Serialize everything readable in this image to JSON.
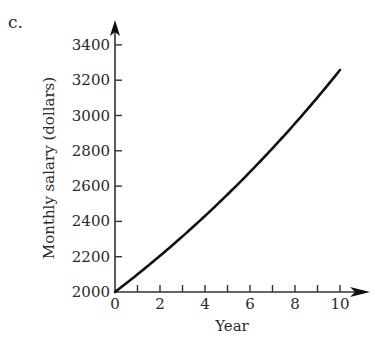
{
  "panel_label": "c.",
  "chart_data": {
    "type": "line",
    "title": "",
    "panel_label": "c.",
    "xlabel": "Year",
    "ylabel": "Monthly salary (dollars)",
    "xlim": [
      0,
      10
    ],
    "ylim": [
      2000,
      3400
    ],
    "x_ticks_major": [
      0,
      2,
      4,
      6,
      8,
      10
    ],
    "x_ticks_minor": [
      1,
      3,
      5,
      7,
      9
    ],
    "y_ticks": [
      2000,
      2200,
      2400,
      2600,
      2800,
      3000,
      3200,
      3400
    ],
    "grid": false,
    "legend": null,
    "series": [
      {
        "name": "Monthly salary",
        "x": [
          0,
          1,
          2,
          3,
          4,
          5,
          6,
          7,
          8,
          9,
          10
        ],
        "y": [
          2000,
          2100,
          2205,
          2315,
          2431,
          2553,
          2680,
          2814,
          2955,
          3103,
          3258
        ]
      }
    ]
  }
}
